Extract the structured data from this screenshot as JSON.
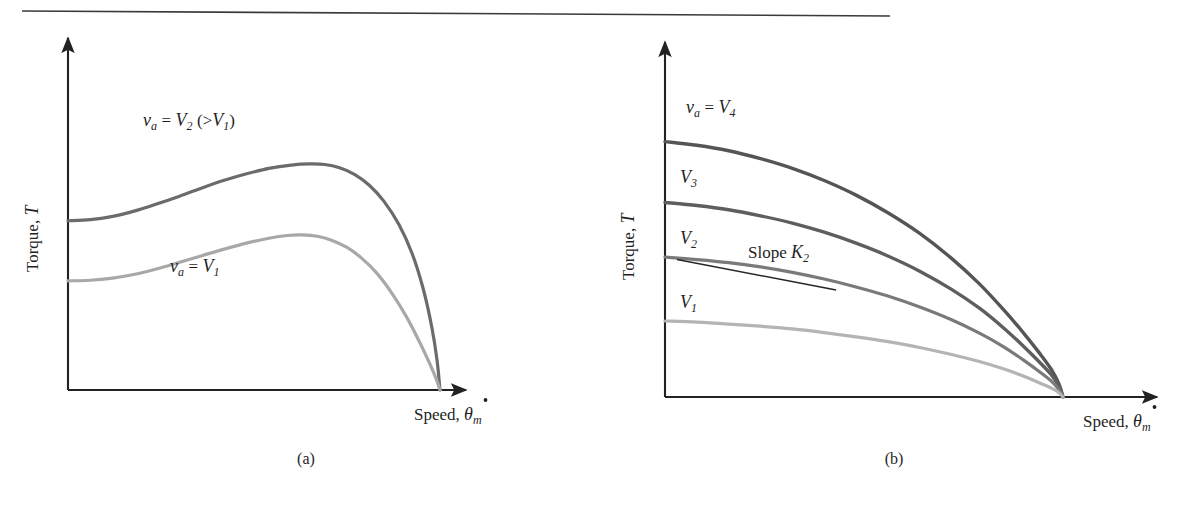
{
  "page": {
    "background_color": "#ffffff",
    "top_rule": {
      "name": "horizontal-rule",
      "color": "#3a3a3a"
    }
  },
  "panels": [
    {
      "id": "a",
      "caption": "(a)",
      "axes": {
        "y_label_text": "Torque,",
        "y_label_symbol": "T",
        "x_label_text": "Speed,",
        "x_label_symbol": "θ",
        "x_label_subscript": "m",
        "x_label_dot": true,
        "axis_color": "#222222"
      },
      "curve_labels": [
        {
          "name": "curve-label-v2",
          "parts": {
            "v": "v",
            "v_sub": "a",
            "eq": "=",
            "V": "V",
            "V_sub": "2",
            "paren_open": "(>",
            "V2": "V",
            "V2_sub": "1",
            "paren_close": ")"
          },
          "plain": "v_a = V_2 (>V_1)"
        },
        {
          "name": "curve-label-v1",
          "parts": {
            "v": "v",
            "v_sub": "a",
            "eq": "=",
            "V": "V",
            "V_sub": "1"
          },
          "plain": "v_a = V_1"
        }
      ]
    },
    {
      "id": "b",
      "caption": "(b)",
      "axes": {
        "y_label_text": "Torque,",
        "y_label_symbol": "T",
        "x_label_text": "Speed,",
        "x_label_symbol": "θ",
        "x_label_subscript": "m",
        "x_label_dot": true,
        "axis_color": "#222222"
      },
      "curve_labels": [
        {
          "name": "curve-label-v4",
          "plain": "v_a = V_4",
          "parts": {
            "v": "v",
            "v_sub": "a",
            "eq": "=",
            "V": "V",
            "V_sub": "4"
          }
        },
        {
          "name": "curve-label-v3",
          "plain": "V_3",
          "parts": {
            "V": "V",
            "V_sub": "3"
          }
        },
        {
          "name": "curve-label-v2",
          "plain": "V_2",
          "parts": {
            "V": "V",
            "V_sub": "2"
          }
        },
        {
          "name": "curve-label-v1",
          "plain": "V_1",
          "parts": {
            "V": "V",
            "V_sub": "1"
          }
        }
      ],
      "annotation": {
        "name": "slope-annotation",
        "text": "Slope",
        "symbol": "K",
        "subscript": "2",
        "plain": "Slope K_2"
      }
    }
  ],
  "chart_data": [
    {
      "type": "line",
      "panel": "a",
      "title": "",
      "xlabel": "Speed, theta_dot_m",
      "ylabel": "Torque, T",
      "xlim": [
        0,
        1
      ],
      "ylim": [
        0,
        1
      ],
      "axis_ticks": "none",
      "grid": false,
      "legend": "inline-annotations",
      "description": "Shunt/armature-controlled DC motor torque-speed curves, two armature voltages; torque rises to a peak then falls steeply to zero at a common no-load speed.",
      "series": [
        {
          "name": "v_a = V_2 (>V_1)",
          "label": "v_a = V_2 (>V_1)",
          "color": "#6b6b6b",
          "width": 3.2,
          "points": [
            [
              0.0,
              0.62
            ],
            [
              0.06,
              0.624
            ],
            [
              0.12,
              0.636
            ],
            [
              0.18,
              0.656
            ],
            [
              0.24,
              0.682
            ],
            [
              0.3,
              0.71
            ],
            [
              0.36,
              0.74
            ],
            [
              0.42,
              0.768
            ],
            [
              0.48,
              0.792
            ],
            [
              0.54,
              0.812
            ],
            [
              0.6,
              0.824
            ],
            [
              0.65,
              0.828
            ],
            [
              0.69,
              0.826
            ],
            [
              0.73,
              0.814
            ],
            [
              0.77,
              0.79
            ],
            [
              0.81,
              0.75
            ],
            [
              0.85,
              0.69
            ],
            [
              0.89,
              0.605
            ],
            [
              0.925,
              0.5
            ],
            [
              0.955,
              0.37
            ],
            [
              0.978,
              0.23
            ],
            [
              0.992,
              0.11
            ],
            [
              1.0,
              0.0
            ]
          ]
        },
        {
          "name": "v_a = V_1",
          "label": "v_a = V_1",
          "color": "#a8a8a8",
          "width": 3.2,
          "points": [
            [
              0.0,
              0.4
            ],
            [
              0.06,
              0.402
            ],
            [
              0.12,
              0.41
            ],
            [
              0.18,
              0.424
            ],
            [
              0.24,
              0.444
            ],
            [
              0.3,
              0.468
            ],
            [
              0.36,
              0.492
            ],
            [
              0.42,
              0.516
            ],
            [
              0.48,
              0.538
            ],
            [
              0.54,
              0.556
            ],
            [
              0.59,
              0.566
            ],
            [
              0.63,
              0.568
            ],
            [
              0.67,
              0.563
            ],
            [
              0.71,
              0.548
            ],
            [
              0.75,
              0.522
            ],
            [
              0.79,
              0.482
            ],
            [
              0.83,
              0.428
            ],
            [
              0.87,
              0.356
            ],
            [
              0.91,
              0.268
            ],
            [
              0.945,
              0.176
            ],
            [
              0.972,
              0.098
            ],
            [
              0.99,
              0.04
            ],
            [
              1.0,
              0.0
            ]
          ]
        }
      ]
    },
    {
      "type": "line",
      "panel": "b",
      "title": "",
      "xlabel": "Speed, theta_dot_m",
      "ylabel": "Torque, T",
      "xlim": [
        0,
        1
      ],
      "ylim": [
        0,
        1
      ],
      "axis_ticks": "none",
      "grid": false,
      "legend": "inline-annotations",
      "description": "Series/field-controlled motor torque-speed curves for four armature voltages V1<V2<V3<V4, each decaying monotonically to zero at a common speed; tangent line marks Slope K2 on the V2 curve.",
      "series": [
        {
          "name": "v_a = V_4",
          "label": "v_a = V_4",
          "color": "#555555",
          "width": 3.4,
          "points": [
            [
              0.0,
              0.84
            ],
            [
              0.08,
              0.828
            ],
            [
              0.16,
              0.81
            ],
            [
              0.24,
              0.784
            ],
            [
              0.32,
              0.752
            ],
            [
              0.4,
              0.712
            ],
            [
              0.48,
              0.664
            ],
            [
              0.56,
              0.606
            ],
            [
              0.64,
              0.538
            ],
            [
              0.72,
              0.456
            ],
            [
              0.79,
              0.372
            ],
            [
              0.85,
              0.288
            ],
            [
              0.9,
              0.212
            ],
            [
              0.94,
              0.146
            ],
            [
              0.97,
              0.092
            ],
            [
              0.99,
              0.042
            ],
            [
              1.0,
              0.0
            ]
          ]
        },
        {
          "name": "V_3",
          "label": "V_3",
          "color": "#5e5e5e",
          "width": 3.4,
          "points": [
            [
              0.0,
              0.64
            ],
            [
              0.08,
              0.63
            ],
            [
              0.16,
              0.616
            ],
            [
              0.24,
              0.596
            ],
            [
              0.32,
              0.572
            ],
            [
              0.4,
              0.542
            ],
            [
              0.48,
              0.506
            ],
            [
              0.56,
              0.464
            ],
            [
              0.64,
              0.414
            ],
            [
              0.72,
              0.354
            ],
            [
              0.79,
              0.292
            ],
            [
              0.85,
              0.228
            ],
            [
              0.9,
              0.168
            ],
            [
              0.94,
              0.116
            ],
            [
              0.97,
              0.074
            ],
            [
              0.99,
              0.034
            ],
            [
              1.0,
              0.0
            ]
          ]
        },
        {
          "name": "V_2",
          "label": "V_2",
          "color": "#7a7a7a",
          "width": 3.2,
          "points": [
            [
              0.0,
              0.46
            ],
            [
              0.08,
              0.452
            ],
            [
              0.16,
              0.442
            ],
            [
              0.24,
              0.428
            ],
            [
              0.32,
              0.41
            ],
            [
              0.4,
              0.388
            ],
            [
              0.48,
              0.362
            ],
            [
              0.56,
              0.332
            ],
            [
              0.64,
              0.296
            ],
            [
              0.72,
              0.254
            ],
            [
              0.79,
              0.21
            ],
            [
              0.85,
              0.166
            ],
            [
              0.9,
              0.122
            ],
            [
              0.94,
              0.084
            ],
            [
              0.97,
              0.053
            ],
            [
              0.99,
              0.024
            ],
            [
              1.0,
              0.0
            ]
          ]
        },
        {
          "name": "V_1",
          "label": "V_1",
          "color": "#b4b4b4",
          "width": 3.2,
          "points": [
            [
              0.0,
              0.25
            ],
            [
              0.08,
              0.246
            ],
            [
              0.16,
              0.24
            ],
            [
              0.24,
              0.233
            ],
            [
              0.32,
              0.224
            ],
            [
              0.4,
              0.212
            ],
            [
              0.48,
              0.198
            ],
            [
              0.56,
              0.182
            ],
            [
              0.64,
              0.163
            ],
            [
              0.72,
              0.14
            ],
            [
              0.79,
              0.117
            ],
            [
              0.85,
              0.093
            ],
            [
              0.9,
              0.069
            ],
            [
              0.94,
              0.047
            ],
            [
              0.97,
              0.03
            ],
            [
              0.99,
              0.014
            ],
            [
              1.0,
              0.0
            ]
          ]
        }
      ],
      "tangent_line": {
        "name": "slope-k2-tangent",
        "label": "Slope K_2",
        "color": "#262626",
        "from": [
          0.03,
          0.452
        ],
        "to": [
          0.43,
          0.352
        ]
      }
    }
  ]
}
